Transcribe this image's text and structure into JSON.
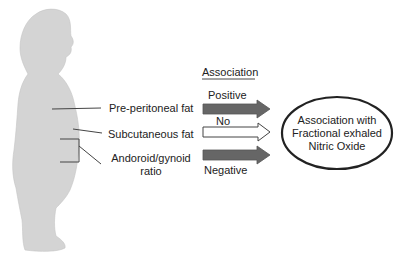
{
  "body_labels": {
    "pre_peritoneal": "Pre-peritoneal fat",
    "subcutaneous": "Subcutaneous fat",
    "android_gynoid_line1": "Andoroid/gynoid",
    "android_gynoid_line2": "ratio"
  },
  "association": {
    "header": "Association",
    "positive": "Positive",
    "none": "No",
    "negative": "Negative"
  },
  "outcome": {
    "line1": "Association with",
    "line2": "Fractional exhaled",
    "line3": "Nitric Oxide"
  },
  "colors": {
    "silhouette": "#d3d3d3",
    "arrow_filled": "#666666",
    "line": "#444444"
  }
}
